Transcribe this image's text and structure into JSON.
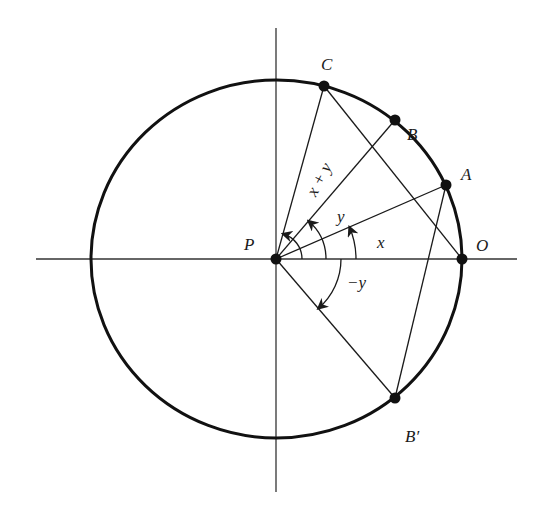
{
  "diagram": {
    "type": "unit-circle-angle-addition",
    "colors": {
      "stroke": "#1a1a1a",
      "background": "#ffffff"
    },
    "circle": {
      "cx": 276.5,
      "cy": 259,
      "rx": 185.5,
      "ry": 179
    },
    "axes": {
      "horizontal": {
        "x1": 36,
        "x2": 517,
        "y": 259
      },
      "vertical": {
        "x": 276,
        "y1": 28,
        "y2": 492
      }
    },
    "points": [
      {
        "id": "P",
        "label": "P",
        "x": 276,
        "y": 259,
        "label_x": 244,
        "label_y": 250
      },
      {
        "id": "O",
        "label": "O",
        "x": 462,
        "y": 259,
        "label_x": 476,
        "label_y": 251
      },
      {
        "id": "A",
        "label": "A",
        "x": 446,
        "y": 185,
        "label_x": 461,
        "label_y": 180
      },
      {
        "id": "B",
        "label": "B",
        "x": 395,
        "y": 120,
        "label_x": 407,
        "label_y": 140
      },
      {
        "id": "C",
        "label": "C",
        "x": 324,
        "y": 86,
        "label_x": 321,
        "label_y": 70
      },
      {
        "id": "Bp",
        "label": "B′",
        "x": 395,
        "y": 398,
        "label_x": 405,
        "label_y": 442
      }
    ],
    "segments": [
      {
        "name": "radius-PA",
        "from": "P",
        "to": "A"
      },
      {
        "name": "radius-PB",
        "from": "P",
        "to": "B"
      },
      {
        "name": "radius-PC",
        "from": "P",
        "to": "C"
      },
      {
        "name": "radius-PBp",
        "from": "P",
        "to": "Bp"
      },
      {
        "name": "chord-CO",
        "from": "C",
        "to": "O"
      },
      {
        "name": "chord-ABp",
        "from": "A",
        "to": "Bp"
      }
    ],
    "angle_labels": {
      "x": {
        "text": "x",
        "x": 377,
        "y": 248
      },
      "y": {
        "text": "y",
        "x": 337,
        "y": 222
      },
      "x_plus_y": {
        "text": "x + y",
        "x": 324,
        "y": 182,
        "rotate": -62
      },
      "minus_y": {
        "text": "−y",
        "x": 347,
        "y": 288
      }
    }
  }
}
